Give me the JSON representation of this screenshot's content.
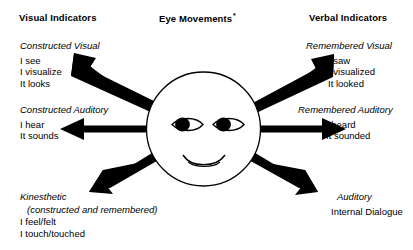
{
  "diagram": {
    "title": "Eye Movements",
    "background_color": "#ffffff",
    "ink_color": "#000000"
  },
  "headers": {
    "left": "Visual Indicators",
    "center": "Eye Movements",
    "center_footnote_marker": "*",
    "right": "Verbal Indicators"
  },
  "quadrants": {
    "upper_left": {
      "lead": "Constructed Visual",
      "lines": [
        "I see",
        "I visualize",
        "It looks"
      ]
    },
    "middle_left": {
      "lead": "Constructed Auditory",
      "lines": [
        "I hear",
        "It sounds"
      ]
    },
    "lower_left": {
      "lead": "Kinesthetic",
      "sub": "(constructed and remembered)",
      "lines": [
        "I feel/felt",
        "I touch/touched"
      ]
    },
    "upper_right": {
      "lead": "Remembered Visual",
      "lines": [
        "I saw",
        "I visualized",
        "It looked"
      ]
    },
    "middle_right": {
      "lead": "Remembered Auditory",
      "lines": [
        "I heard",
        "It sounded"
      ]
    },
    "lower_right": {
      "lead": "Auditory",
      "lines": [
        "Internal Dialogue"
      ]
    }
  },
  "face": {
    "name": "smiley-face",
    "eyes": [
      "left-eye",
      "right-eye"
    ],
    "mouth": "smile"
  },
  "arrows": [
    {
      "name": "arrow-upper-left",
      "direction": "up-left"
    },
    {
      "name": "arrow-middle-left",
      "direction": "left"
    },
    {
      "name": "arrow-lower-left",
      "direction": "down-left"
    },
    {
      "name": "arrow-upper-right",
      "direction": "up-right"
    },
    {
      "name": "arrow-middle-right",
      "direction": "right"
    },
    {
      "name": "arrow-lower-right",
      "direction": "down-right"
    }
  ]
}
